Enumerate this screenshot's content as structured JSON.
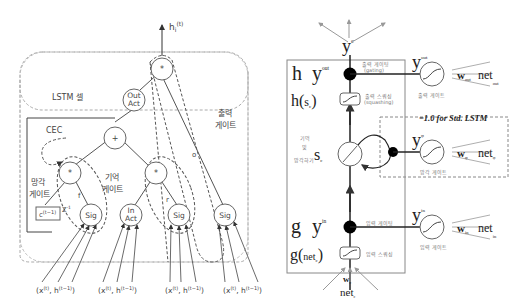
{
  "left_diagram": {
    "output_label": "h",
    "output_sub": "i",
    "output_sup": "(t)",
    "cell_label": "LSTM 셀",
    "cec_label": "CEC",
    "out_act": [
      "Out",
      "Act"
    ],
    "in_act": [
      "In",
      "Act"
    ],
    "plus": "+",
    "mult": "*",
    "sig": "Sig",
    "forget_gate": [
      "망각",
      "게이트"
    ],
    "memory_gate": [
      "기억",
      "게이트"
    ],
    "output_gate": [
      "출력",
      "게이트"
    ],
    "prev_cell": "c",
    "prev_cell_sup": "(t−1)",
    "delay": "Z",
    "delay_sup": "-1",
    "edge_f": "f",
    "edge_r": "r",
    "edge_o": "o",
    "input_label": "(x(t), h(t−1))",
    "inputs": [
      {
        "x": "(x",
        "xs": "(t)",
        "h": ", h",
        "hs": "(t−1)",
        "close": ")"
      },
      {
        "x": "(x",
        "xs": "(t)",
        "h": ", h",
        "hs": "(t−1)",
        "close": ")"
      },
      {
        "x": "(x",
        "xs": "(t)",
        "h": ", h",
        "hs": "(t−1)",
        "close": ")"
      },
      {
        "x": "(x",
        "xs": "(t)",
        "h": ", h",
        "hs": "(t−1)",
        "close": ")"
      }
    ]
  },
  "right_diagram": {
    "top_output": "y",
    "top_output_sup": "c",
    "h_label": "h",
    "y_out": "y",
    "y_out_sup": "out",
    "h_sc": "h(",
    "h_sc_s": "s",
    "h_sc_sub": "c",
    "h_sc_close": ")",
    "output_gating": [
      "출력 게이팅",
      "(gating)"
    ],
    "output_squashing": [
      "출력 스쿼싱",
      "(squashing)"
    ],
    "output_gate_label": "출력 게이트",
    "w_out": "w",
    "w_out_sub": "out",
    "net_out": "net",
    "net_out_sub": "out",
    "std_lstm_note": "=1.0 for Std. LSTM",
    "s_c": "s",
    "s_c_sub": "c",
    "memory_forget": [
      "기억",
      "및",
      "망각하기"
    ],
    "y_phi": "y",
    "y_phi_sup": "φ",
    "w_phi": "w",
    "w_phi_sub": "φ",
    "net_phi": "net",
    "net_phi_sub": "φ",
    "forget_gate_label": "망각 게이트",
    "g_label": "g",
    "y_in": "y",
    "y_in_sup": "in",
    "input_gating": "입력 게이팅",
    "g_net": "g(",
    "g_net_inner": "net",
    "g_net_sub": "c",
    "g_net_close": ")",
    "input_squashing": "입력 스쿼싱",
    "w_in": "w",
    "w_in_sub": "in",
    "net_in": "net",
    "net_in_sub": "in",
    "input_gate_label": "입력 게이트",
    "w_c": "w",
    "w_c_sub": "c",
    "net_c": "net",
    "net_c_sub": "c"
  }
}
